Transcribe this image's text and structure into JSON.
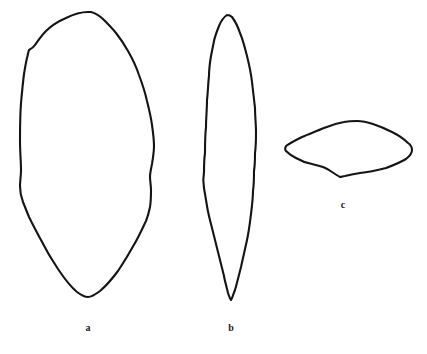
{
  "figure": {
    "background_color": "#ffffff",
    "stroke_color": "#141414",
    "width": 427,
    "height": 354,
    "specimens": [
      {
        "id": "a",
        "label": "a",
        "name": "specimen-a",
        "description": "Large elongate ovate outline, broadly rounded apex, tapering to a narrow rounded base",
        "bbox": {
          "x": 19,
          "y": 11,
          "width": 137,
          "height": 288
        },
        "shape_kind": "ovate"
      },
      {
        "id": "b",
        "label": "b",
        "name": "specimen-b",
        "description": "Narrow lanceolate outline, pointed apex and pointed base, greatest width near the middle",
        "bbox": {
          "x": 203,
          "y": 14,
          "width": 54,
          "height": 286
        },
        "shape_kind": "lanceolate"
      },
      {
        "id": "c",
        "label": "c",
        "name": "specimen-c",
        "description": "Small transverse rhombic to lenticular outline, wider than tall, with lateral points",
        "bbox": {
          "x": 285,
          "y": 120,
          "width": 128,
          "height": 57
        },
        "shape_kind": "rhombic"
      }
    ]
  },
  "caption": {
    "text": "",
    "visible": false
  }
}
